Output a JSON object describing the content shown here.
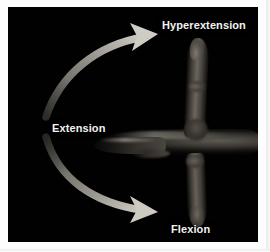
{
  "figure": {
    "kind": "anatomy-photograph",
    "background_color": "#010101",
    "mount_color": "#fdfdfd",
    "label_color": "#f2f2f0",
    "arrow_color": "#b9b6ae"
  },
  "labels": {
    "hyperextension": "Hyperextension",
    "extension": "Extension",
    "flexion": "Flexion"
  },
  "annotations": [
    {
      "name": "upper-motion-arrow",
      "icon": "curved-arrow-up-right-icon",
      "points_from": "Extension",
      "points_to": "Hyperextension"
    },
    {
      "name": "lower-motion-arrow",
      "icon": "curved-arrow-down-right-icon",
      "points_from": "Extension",
      "points_to": "Flexion"
    }
  ],
  "limbs": [
    {
      "name": "forearm-horizontal",
      "pose": "extension"
    },
    {
      "name": "hand-upward",
      "pose": "hyperextension"
    },
    {
      "name": "hand-downward",
      "pose": "flexion"
    }
  ]
}
